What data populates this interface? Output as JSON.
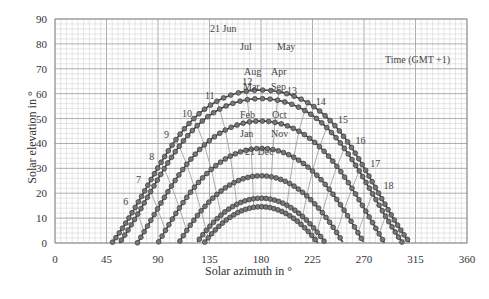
{
  "chart_data": {
    "type": "line",
    "title": "",
    "xlabel": "Solar azimuth in °",
    "ylabel": "Solar elevation in °",
    "xlim": [
      0,
      360
    ],
    "ylim": [
      0,
      90
    ],
    "x_ticks": [
      0,
      45,
      90,
      135,
      180,
      225,
      270,
      315,
      360
    ],
    "y_ticks": [
      0,
      10,
      20,
      30,
      40,
      50,
      60,
      70,
      80,
      90
    ],
    "grid": true,
    "legend": "inline labels",
    "time_label": "Time (GMT +1)",
    "latitude_deg": 52,
    "timezone_offset_h": 1,
    "series": [
      {
        "name": "21 Jun",
        "declination": 23.44,
        "peak_elevation": 84,
        "sunrise_azimuth": 62
      },
      {
        "name": "Jul / May",
        "declination": 20.0,
        "peak_elevation": 81,
        "sunrise_azimuth": 65
      },
      {
        "name": "Aug / Apr",
        "declination": 11.0,
        "peak_elevation": 72,
        "sunrise_azimuth": 77
      },
      {
        "name": "Mar / Sep",
        "declination": 0.0,
        "peak_elevation": 61,
        "sunrise_azimuth": 90
      },
      {
        "name": "Feb / Oct",
        "declination": -11.0,
        "peak_elevation": 50,
        "sunrise_azimuth": 103
      },
      {
        "name": "Jan / Nov",
        "declination": -20.0,
        "peak_elevation": 40,
        "sunrise_azimuth": 113
      },
      {
        "name": "21 Dec",
        "declination": -23.44,
        "peak_elevation": 37,
        "sunrise_azimuth": 116
      }
    ],
    "hour_labels": [
      6,
      7,
      8,
      9,
      10,
      11,
      12,
      13,
      14,
      15,
      16,
      17,
      18
    ],
    "month_labels": [
      {
        "text": "21 Jun",
        "x": 210,
        "y": 32
      },
      {
        "text": "Jul",
        "x": 240,
        "y": 50
      },
      {
        "text": "May",
        "x": 277,
        "y": 50
      },
      {
        "text": "Aug",
        "x": 244,
        "y": 75
      },
      {
        "text": "Apr",
        "x": 271,
        "y": 75
      },
      {
        "text": "Mar",
        "x": 243,
        "y": 90
      },
      {
        "text": "Sep",
        "x": 271,
        "y": 90
      },
      {
        "text": "Feb",
        "x": 240,
        "y": 118
      },
      {
        "text": "Oct",
        "x": 272,
        "y": 118
      },
      {
        "text": "Jan",
        "x": 240,
        "y": 137
      },
      {
        "text": "Nov",
        "x": 271,
        "y": 137
      },
      {
        "text": "21 Dec",
        "x": 245,
        "y": 155
      }
    ]
  },
  "labels": {
    "xlabel": "Solar azimuth in °",
    "ylabel": "Solar elevation in °",
    "time": "Time (GMT +1)"
  }
}
